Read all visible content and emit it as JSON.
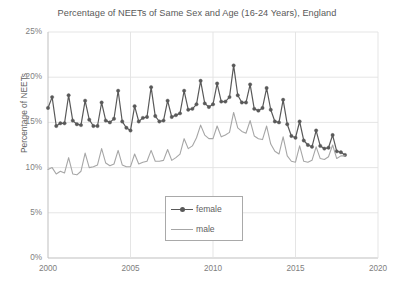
{
  "top_bleed_text": "...",
  "chart_data": {
    "type": "line",
    "title": "Percentage of NEETs of Same Sex and Age (16-24 Years), England",
    "xlabel": "",
    "ylabel": "Percentage of NEETs",
    "xlim": [
      2000,
      2020
    ],
    "ylim": [
      0,
      25
    ],
    "grid": true,
    "legend_position": "inside-bottom-center",
    "x_ticks": [
      "2000",
      "2005",
      "2010",
      "2015",
      "2020"
    ],
    "x_tick_values": [
      2000,
      2005,
      2010,
      2015,
      2020
    ],
    "y_ticks": [
      "0%",
      "5%",
      "10%",
      "15%",
      "20%",
      "25%"
    ],
    "y_tick_values": [
      0,
      5,
      10,
      15,
      20,
      25
    ],
    "x": [
      2000.0,
      2000.25,
      2000.5,
      2000.75,
      2001.0,
      2001.25,
      2001.5,
      2001.75,
      2002.0,
      2002.25,
      2002.5,
      2002.75,
      2003.0,
      2003.25,
      2003.5,
      2003.75,
      2004.0,
      2004.25,
      2004.5,
      2004.75,
      2005.0,
      2005.25,
      2005.5,
      2005.75,
      2006.0,
      2006.25,
      2006.5,
      2006.75,
      2007.0,
      2007.25,
      2007.5,
      2007.75,
      2008.0,
      2008.25,
      2008.5,
      2008.75,
      2009.0,
      2009.25,
      2009.5,
      2009.75,
      2010.0,
      2010.25,
      2010.5,
      2010.75,
      2011.0,
      2011.25,
      2011.5,
      2011.75,
      2012.0,
      2012.25,
      2012.5,
      2012.75,
      2013.0,
      2013.25,
      2013.5,
      2013.75,
      2014.0,
      2014.25,
      2014.5,
      2014.75,
      2015.0,
      2015.25,
      2015.5,
      2015.75,
      2016.0,
      2016.25,
      2016.5,
      2016.75,
      2017.0,
      2017.25,
      2017.5,
      2017.75,
      2018.0
    ],
    "series": [
      {
        "name": "female",
        "color": "#595959",
        "marker": "diamond",
        "values": [
          16.6,
          17.8,
          14.6,
          14.9,
          14.9,
          18.0,
          15.2,
          14.8,
          14.7,
          17.4,
          15.3,
          14.6,
          14.6,
          17.2,
          15.2,
          15.0,
          15.4,
          18.5,
          15.1,
          14.4,
          14.1,
          16.8,
          15.1,
          15.5,
          15.6,
          18.9,
          15.7,
          15.1,
          15.2,
          17.4,
          15.6,
          15.8,
          16.0,
          18.5,
          16.4,
          16.5,
          17.0,
          19.6,
          17.1,
          16.7,
          17.0,
          19.3,
          17.3,
          17.3,
          17.8,
          21.3,
          18.0,
          17.2,
          17.2,
          19.2,
          16.5,
          16.3,
          16.6,
          18.8,
          16.4,
          15.1,
          15.0,
          17.5,
          14.8,
          13.5,
          13.3,
          15.1,
          13.0,
          12.5,
          12.3,
          14.1,
          12.4,
          12.1,
          12.2,
          13.6,
          11.8,
          11.7,
          11.4
        ],
        "style": "solid-with-markers"
      },
      {
        "name": "male",
        "color": "#a6a6a6",
        "marker": "none",
        "values": [
          9.8,
          10.0,
          9.3,
          9.6,
          9.4,
          11.1,
          9.3,
          9.2,
          9.6,
          11.6,
          10.0,
          10.1,
          10.3,
          12.1,
          10.5,
          10.2,
          10.4,
          11.9,
          10.3,
          10.1,
          10.1,
          11.5,
          10.4,
          10.6,
          10.7,
          11.9,
          10.7,
          10.7,
          10.8,
          12.0,
          10.8,
          11.1,
          11.5,
          13.2,
          12.1,
          12.4,
          13.3,
          14.7,
          13.6,
          13.2,
          13.2,
          14.6,
          13.4,
          13.6,
          13.9,
          16.1,
          14.4,
          14.0,
          13.8,
          15.2,
          13.5,
          13.2,
          13.1,
          14.6,
          12.6,
          11.8,
          11.5,
          13.4,
          11.3,
          10.7,
          10.6,
          12.4,
          10.7,
          10.6,
          10.8,
          12.3,
          11.0,
          10.9,
          11.2,
          12.5,
          11.0,
          11.3,
          11.3
        ],
        "style": "solid"
      }
    ]
  }
}
